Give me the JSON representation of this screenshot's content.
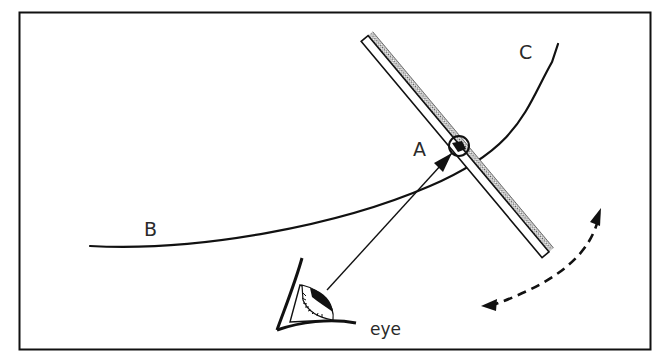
{
  "diagram": {
    "type": "optics-figure",
    "colors": {
      "ink": "#111111",
      "label": "#2a2a2a",
      "background": "#ffffff",
      "mirror_hatch": "#555555"
    },
    "labels": {
      "point_a": "A",
      "curve_end_b": "B",
      "curve_end_c": "C",
      "observer": "eye"
    },
    "elements": {
      "frame": "rectangular border",
      "curve": "smooth curve from B through A to C",
      "mirror": "plane mirror with shaded back, crossing curve at A",
      "contact_circle": "small circle marking point A on mirror",
      "sight_line": "line with arrow from eye to A",
      "rotation_arrow": "dashed double-headed curved arrow"
    }
  }
}
